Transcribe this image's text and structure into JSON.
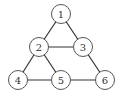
{
  "diagram": {
    "type": "graph",
    "nodes": [
      {
        "id": "1",
        "label": "1",
        "x": 61,
        "y": 14
      },
      {
        "id": "2",
        "label": "2",
        "x": 39,
        "y": 47
      },
      {
        "id": "3",
        "label": "3",
        "x": 83,
        "y": 47
      },
      {
        "id": "4",
        "label": "4",
        "x": 18,
        "y": 80
      },
      {
        "id": "5",
        "label": "5",
        "x": 61,
        "y": 80
      },
      {
        "id": "6",
        "label": "6",
        "x": 105,
        "y": 80
      }
    ],
    "edges": [
      [
        "1",
        "2"
      ],
      [
        "1",
        "3"
      ],
      [
        "2",
        "3"
      ],
      [
        "2",
        "4"
      ],
      [
        "2",
        "5"
      ],
      [
        "3",
        "6"
      ],
      [
        "4",
        "5"
      ],
      [
        "5",
        "6"
      ]
    ],
    "node_radius": 9.5,
    "colors": {
      "edge": "#333333",
      "node_stroke": "#555555",
      "node_fill": "#ffffff",
      "label": "#333333"
    }
  }
}
